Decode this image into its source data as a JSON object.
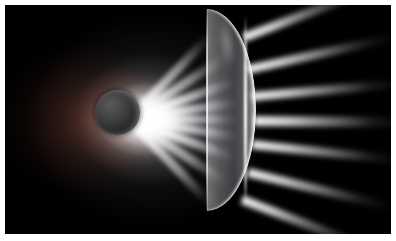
{
  "image": {
    "title": "Refraction through a plano-convex lens",
    "domain": "Natural-Image",
    "kind": "3d-render",
    "subject": "light rays from an occluded source refracting through a lens",
    "width": 396,
    "height": 241,
    "frame": {
      "border_color": "#ffffff",
      "border_px_left": 5,
      "border_px_top": 5,
      "border_px_right": 5,
      "border_px_bottom": 7
    },
    "background_color": "#000000"
  },
  "palette": {
    "background": "#000000",
    "frame": "#ffffff",
    "beam_white": "#ffffff",
    "halo_warm": "#602e22",
    "sphere_light": "#5a5a5c",
    "sphere_dark": "#0c0c0e",
    "lens_glass": "#c8cad2",
    "lens_rim": "#ffffff"
  },
  "objects": {
    "sphere": {
      "label": "occluding sphere",
      "center_x_pct": 29.1,
      "center_y_pct": 47.0,
      "radius_pct": 5.8,
      "shading": "dark grey, lit from upper-left, bright rim on right"
    },
    "lens": {
      "label": "plano-convex lens",
      "left_pct": 52.4,
      "top_pct": 1.8,
      "width_pct": 12.6,
      "height_pct": 88.0,
      "shape": "crescent: flat vertical left face, convex right face",
      "top_tip": "x 205, y 12",
      "bottom_tip": "x 203, y 208",
      "max_bulge_x": 248
    },
    "halo": {
      "label": "warm diffuse halo",
      "center_x_pct": 22,
      "center_y_pct": 50,
      "tint": "#602e22"
    }
  },
  "beams": {
    "label": "incident beam fan",
    "origin_x_pct": 32,
    "origin_y_pct": 50,
    "angles_deg": [
      -46,
      -33,
      -20,
      -9,
      0,
      9,
      20,
      33,
      46
    ],
    "lengths_px": [
      118,
      116,
      112,
      110,
      108,
      110,
      112,
      116,
      118
    ]
  },
  "rays": {
    "label": "refracted exit rays",
    "items": [
      {
        "left_pct": 62.0,
        "top_pct": 14.0,
        "angle_deg": -21.0,
        "length_px": 150,
        "thickness_px": 9
      },
      {
        "left_pct": 63.0,
        "top_pct": 28.0,
        "angle_deg": -12.5,
        "length_px": 152,
        "thickness_px": 9
      },
      {
        "left_pct": 64.0,
        "top_pct": 40.0,
        "angle_deg": -5.0,
        "length_px": 150,
        "thickness_px": 9
      },
      {
        "left_pct": 64.5,
        "top_pct": 50.5,
        "angle_deg": 0.5,
        "length_px": 150,
        "thickness_px": 10
      },
      {
        "left_pct": 64.0,
        "top_pct": 61.0,
        "angle_deg": 6.0,
        "length_px": 150,
        "thickness_px": 9
      },
      {
        "left_pct": 63.0,
        "top_pct": 73.0,
        "angle_deg": 13.5,
        "length_px": 150,
        "thickness_px": 9
      },
      {
        "left_pct": 61.5,
        "top_pct": 85.0,
        "angle_deg": 21.0,
        "length_px": 146,
        "thickness_px": 9
      }
    ]
  }
}
